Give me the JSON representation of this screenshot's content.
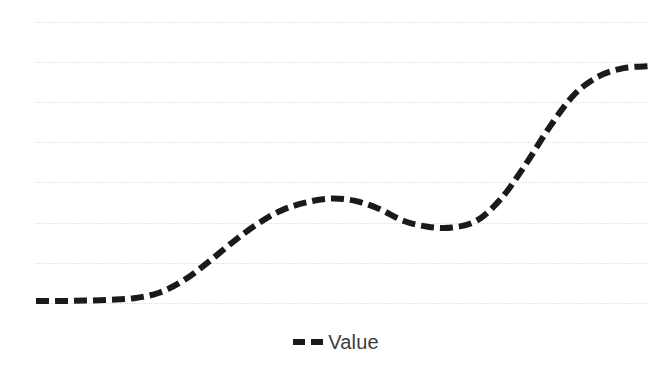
{
  "chart_data": {
    "type": "line",
    "title": "",
    "subtitle": "",
    "xlabel": "",
    "ylabel": "",
    "grid": true,
    "gridlines_count": 8,
    "legend_position": "bottom-center",
    "background_color": "#ffffff",
    "gridline_color": "#d9d9d9",
    "axis_range": {
      "xlim": [
        0,
        100
      ],
      "ylim": [
        0,
        7
      ]
    },
    "plot_area_px": {
      "left": 36,
      "right": 648,
      "top": 22,
      "bottom": 303
    },
    "gridline_y_values": [
      7,
      6,
      5,
      4,
      3,
      2,
      1,
      0
    ],
    "gridline_y_px": [
      22,
      62,
      102,
      142,
      182,
      223,
      263,
      303
    ],
    "series": [
      {
        "name": "Value",
        "color": "#1a1a1a",
        "line_style": "dashed",
        "line_width": 6,
        "dash_pattern": "13 6",
        "x": [
          0,
          4,
          8,
          12,
          16,
          20,
          24,
          28,
          32,
          36,
          40,
          44,
          48,
          52,
          56,
          60,
          64,
          68,
          72,
          76,
          80,
          84,
          88,
          92,
          96,
          100
        ],
        "values": [
          0.05,
          0.05,
          0.06,
          0.08,
          0.12,
          0.25,
          0.55,
          1.0,
          1.5,
          1.95,
          2.3,
          2.5,
          2.6,
          2.55,
          2.35,
          2.05,
          1.9,
          1.88,
          2.05,
          2.6,
          3.45,
          4.4,
          5.2,
          5.65,
          5.85,
          5.9
        ]
      }
    ]
  },
  "legend": {
    "entries": [
      {
        "label": "Value",
        "marker": "dashed-line-marker",
        "color": "#1a1a1a"
      }
    ]
  }
}
